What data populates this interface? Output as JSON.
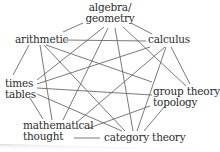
{
  "diagram": {
    "type": "complete-graph",
    "nodes": [
      {
        "id": "algebra_geometry",
        "line1": "algebra/",
        "line2": "geometry"
      },
      {
        "id": "arithmetic",
        "line1": "arithmetic"
      },
      {
        "id": "calculus",
        "line1": "calculus"
      },
      {
        "id": "times_tables",
        "line1": "times",
        "line2": "tables"
      },
      {
        "id": "group_theory_topology",
        "line1": "group theory/",
        "line2": "topology"
      },
      {
        "id": "mathematical_thought",
        "line1": "mathematical",
        "line2": "thought"
      },
      {
        "id": "category_theory",
        "line1": "category theory"
      }
    ],
    "edges": [
      [
        "algebra_geometry",
        "arithmetic"
      ],
      [
        "algebra_geometry",
        "calculus"
      ],
      [
        "algebra_geometry",
        "times_tables"
      ],
      [
        "algebra_geometry",
        "mathematical_thought"
      ],
      [
        "algebra_geometry",
        "category_theory"
      ],
      [
        "algebra_geometry",
        "group_theory_topology"
      ],
      [
        "arithmetic",
        "calculus"
      ],
      [
        "arithmetic",
        "times_tables"
      ],
      [
        "arithmetic",
        "mathematical_thought"
      ],
      [
        "arithmetic",
        "group_theory_topology"
      ],
      [
        "arithmetic",
        "category_theory"
      ],
      [
        "calculus",
        "times_tables"
      ],
      [
        "calculus",
        "mathematical_thought"
      ],
      [
        "calculus",
        "category_theory"
      ],
      [
        "calculus",
        "group_theory_topology"
      ],
      [
        "times_tables",
        "group_theory_topology"
      ],
      [
        "times_tables",
        "category_theory"
      ],
      [
        "times_tables",
        "mathematical_thought"
      ],
      [
        "group_theory_topology",
        "mathematical_thought"
      ],
      [
        "group_theory_topology",
        "category_theory"
      ],
      [
        "mathematical_thought",
        "category_theory"
      ]
    ],
    "colors": {
      "edge": "#6a6a6a",
      "text": "#2c2c2c",
      "background": "#ffffff"
    }
  }
}
